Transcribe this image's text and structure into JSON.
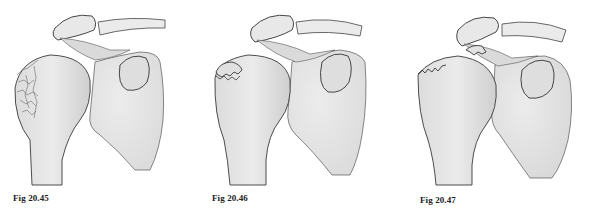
{
  "figures": [
    {
      "id": "20.45",
      "caption": "Fig 20.45",
      "description": "Humeral head with comminuted fracture of the greater tuberosity"
    },
    {
      "id": "20.46",
      "caption": "Fig 20.46",
      "description": "Humeral head with minimally displaced greater tuberosity fracture fragment"
    },
    {
      "id": "20.47",
      "caption": "Fig 20.47",
      "description": "Humeral head with displaced greater tuberosity fragment lodged under acromion"
    }
  ],
  "colors": {
    "bone_fill": "#e6e6e6",
    "bone_shade": "#cfcfcf",
    "outline": "#3a3a3a",
    "background": "#ffffff"
  }
}
